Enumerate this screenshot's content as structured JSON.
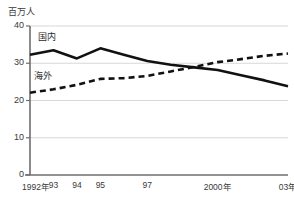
{
  "chart_data": {
    "type": "line",
    "title": "",
    "subtitle": "",
    "unit_label": "百万人",
    "xlabel": "",
    "ylabel": "",
    "ylim": [
      0,
      40
    ],
    "yticks": [
      0,
      10,
      20,
      30,
      40
    ],
    "ytick_labels": [
      "0",
      "10",
      "20",
      "30",
      "40"
    ],
    "grid": true,
    "grid_axis": "y",
    "legend_position": "inline",
    "x": [
      1992,
      1993,
      1994,
      1995,
      1996,
      1997,
      1998,
      1999,
      2000,
      2001,
      2002,
      2003
    ],
    "xtick_values": [
      1992,
      1993,
      1994,
      1995,
      1997,
      2000,
      2003
    ],
    "xtick_labels": [
      "1992年",
      "93",
      "94",
      "95",
      "97",
      "2000年",
      "03年"
    ],
    "series": [
      {
        "name": "国内",
        "style": "solid",
        "color": "#111111",
        "values": [
          32.3,
          33.5,
          31.3,
          34.0,
          32.3,
          30.6,
          29.6,
          28.9,
          28.2,
          26.8,
          25.4,
          23.8
        ]
      },
      {
        "name": "海外",
        "style": "dashed",
        "color": "#111111",
        "values": [
          22.1,
          23.0,
          24.2,
          25.8,
          26.0,
          26.6,
          27.8,
          29.0,
          30.3,
          31.1,
          32.0,
          32.6
        ]
      }
    ],
    "annotations": [
      {
        "text": "国内",
        "x_px": 38,
        "y_px": 30
      },
      {
        "text": "海外",
        "x_px": 34,
        "y_px": 69
      }
    ],
    "axis_color": "#8c8c8c",
    "grid_color": "#d8d8d8",
    "text_color": "#3a3a3a"
  }
}
